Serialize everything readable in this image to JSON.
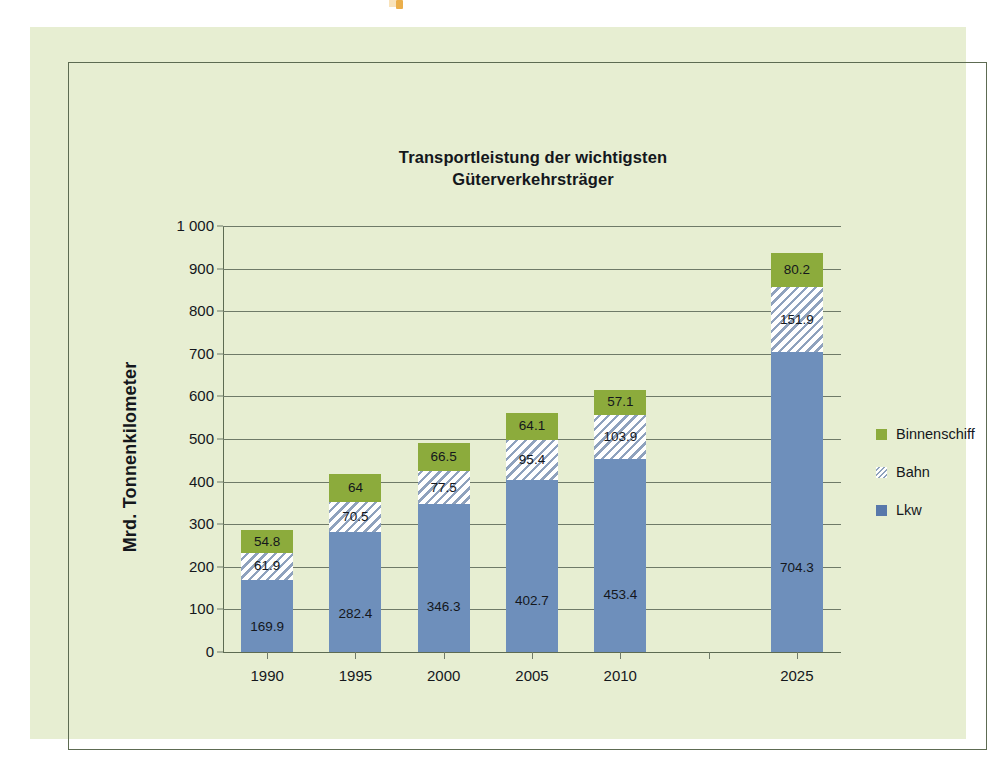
{
  "chart_data": {
    "type": "bar",
    "subtype": "stacked-bar",
    "title": "Transportleistung der wichtigsten\nGüterverkehrsträger",
    "title_line1": "Transportleistung der wichtigsten",
    "title_line2": "Güterverkehrsträger",
    "xlabel": "",
    "ylabel": "Mrd. Tonnenkilometer",
    "ylim": [
      0,
      1000
    ],
    "ytick_step": 100,
    "ytick_labels": [
      "1 000",
      "900",
      "800",
      "700",
      "600",
      "500",
      "400",
      "300",
      "200",
      "100",
      "0"
    ],
    "ytick_values": [
      1000,
      900,
      800,
      700,
      600,
      500,
      400,
      300,
      200,
      100,
      0
    ],
    "grid": true,
    "grid_axis": "y",
    "legend_position": "right",
    "categories": [
      "1990",
      "1995",
      "2000",
      "2005",
      "2010",
      "",
      "2025"
    ],
    "series": [
      {
        "name": "Lkw",
        "color": "#6e8fbb",
        "pattern": "solid",
        "values": [
          169.9,
          282.4,
          346.3,
          402.7,
          453.4,
          null,
          704.3
        ],
        "labels": [
          "169.9",
          "282.4",
          "346.3",
          "402.7",
          "453.4",
          "",
          "704.3"
        ]
      },
      {
        "name": "Bahn",
        "color": "#ffffff",
        "pattern": "diagonal-hatch",
        "values": [
          61.9,
          70.5,
          77.5,
          95.4,
          103.9,
          null,
          151.9
        ],
        "labels": [
          "61.9",
          "70.5",
          "77.5",
          "95.4",
          "103.9",
          "",
          "151.9"
        ]
      },
      {
        "name": "Binnenschiff",
        "color": "#8cab3c",
        "pattern": "solid",
        "values": [
          54.8,
          64.0,
          66.5,
          64.1,
          57.1,
          null,
          80.2
        ],
        "labels": [
          "54.8",
          "64",
          "66.5",
          "64.1",
          "57.1",
          "",
          "80.2"
        ]
      }
    ],
    "stack_order_bottom_to_top": [
      "Lkw",
      "Bahn",
      "Binnenschiff"
    ],
    "totals": [
      286.6,
      416.9,
      490.3,
      562.2,
      614.4,
      null,
      936.4
    ]
  },
  "legend": {
    "entries": [
      {
        "label": "Binnenschiff",
        "swatch": "sw-schiff"
      },
      {
        "label": "Bahn",
        "swatch": "sw-bahn"
      },
      {
        "label": "Lkw",
        "swatch": "sw-lkw"
      }
    ]
  },
  "colors": {
    "page_background": "#e7eed2",
    "frame_border": "#5d6b52",
    "gridline": "#6f7a68",
    "text": "#14171c",
    "lkw": "#6e8fbb",
    "bahn": "#ffffff",
    "binnenschiff": "#8cab3c",
    "artifact_orange": "#e8a22c"
  }
}
